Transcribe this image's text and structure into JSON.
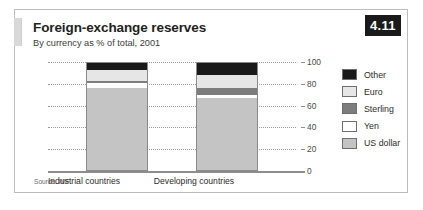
{
  "figure": {
    "number": "4.11",
    "title": "Foreign-exchange reserves",
    "subtitle": "By currency as % of total, 2001",
    "source": "Source: IMF"
  },
  "legend": {
    "position": "right",
    "items": [
      {
        "label": "Other",
        "color": "#1a1a1a"
      },
      {
        "label": "Euro",
        "color": "#e6e6e6"
      },
      {
        "label": "Sterling",
        "color": "#7d7d7d"
      },
      {
        "label": "Yen",
        "color": "#ffffff"
      },
      {
        "label": "US dollar",
        "color": "#c4c4c4"
      }
    ]
  },
  "chart_data": {
    "type": "bar",
    "stacked": true,
    "title": "Foreign-exchange reserves",
    "subtitle": "By currency as % of total, 2001",
    "xlabel": "",
    "ylabel": "",
    "ylim": [
      0,
      100
    ],
    "yticks": [
      100,
      80,
      60,
      40,
      20,
      0
    ],
    "grid": true,
    "categories": [
      "Industrial countries",
      "Developing countries"
    ],
    "series": [
      {
        "name": "US dollar",
        "color": "#c4c4c4",
        "values": [
          77,
          67
        ]
      },
      {
        "name": "Yen",
        "color": "#ffffff",
        "values": [
          4,
          3
        ]
      },
      {
        "name": "Sterling",
        "color": "#7d7d7d",
        "values": [
          2,
          7
        ]
      },
      {
        "name": "Euro",
        "color": "#e6e6e6",
        "values": [
          10,
          12
        ]
      },
      {
        "name": "Other",
        "color": "#1a1a1a",
        "values": [
          7,
          11
        ]
      }
    ]
  }
}
